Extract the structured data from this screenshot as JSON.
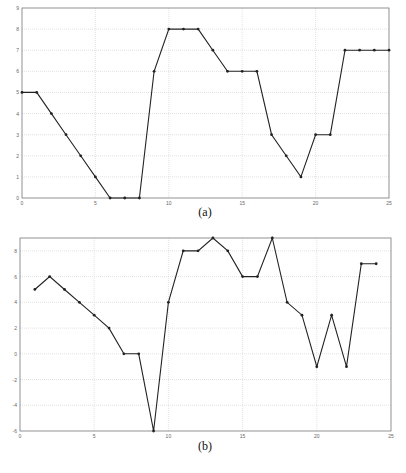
{
  "captions": {
    "a": "(a)",
    "b": "(b)"
  },
  "colors": {
    "line": "#222222",
    "grid": "#cfcfcf",
    "axis": "#777777",
    "tick_text": "#666666"
  },
  "chart_data": [
    {
      "type": "line",
      "title": "",
      "caption": "(a)",
      "xlabel": "",
      "ylabel": "",
      "xlim": [
        0,
        25
      ],
      "ylim": [
        0,
        9
      ],
      "xticks": [
        0,
        5,
        10,
        15,
        20,
        25
      ],
      "yticks": [
        0,
        1,
        2,
        3,
        4,
        5,
        6,
        7,
        8,
        9
      ],
      "grid": true,
      "x": [
        0,
        1,
        2,
        3,
        4,
        5,
        6,
        7,
        8,
        9,
        10,
        11,
        12,
        13,
        14,
        15,
        16,
        17,
        18,
        19,
        20,
        21,
        22,
        23,
        24,
        25
      ],
      "values": [
        5,
        5,
        4,
        3,
        2,
        1,
        0,
        0,
        0,
        6,
        8,
        8,
        8,
        7,
        6,
        6,
        6,
        3,
        2,
        1,
        3,
        3,
        7,
        7,
        7,
        7
      ],
      "markers": true
    },
    {
      "type": "line",
      "title": "",
      "caption": "(b)",
      "xlabel": "",
      "ylabel": "",
      "xlim": [
        0,
        25
      ],
      "ylim": [
        -6,
        9
      ],
      "xticks": [
        0,
        5,
        10,
        15,
        20,
        25
      ],
      "yticks": [
        -6,
        -4,
        -2,
        0,
        2,
        4,
        6,
        8
      ],
      "grid": true,
      "x": [
        1,
        2,
        3,
        4,
        5,
        6,
        7,
        8,
        9,
        10,
        11,
        12,
        13,
        14,
        15,
        16,
        17,
        18,
        19,
        20,
        21,
        22,
        23,
        24
      ],
      "values": [
        5,
        6,
        5,
        4,
        3,
        2,
        0,
        0,
        -6,
        4,
        8,
        8,
        9,
        8,
        6,
        6,
        9,
        4,
        3,
        -1,
        3,
        -1,
        7,
        7
      ],
      "markers": true
    }
  ]
}
